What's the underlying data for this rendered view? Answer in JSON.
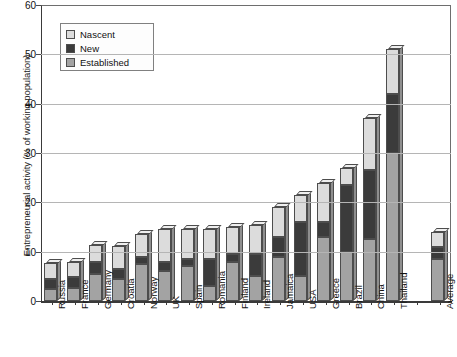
{
  "chart_data": {
    "type": "bar",
    "subtype": "stacked-3d-column",
    "title": "",
    "xlabel": "",
    "ylabel": "Entrepreneurial activity (% of working population)",
    "ylim": [
      0,
      60
    ],
    "yticks": [
      0,
      10,
      20,
      30,
      40,
      50,
      60
    ],
    "ytick_labels": [
      "0",
      "10",
      "20",
      "30",
      "40",
      "50",
      "60"
    ],
    "grid": true,
    "legend_position": "top-left-inside",
    "categories": [
      "Russia",
      "France",
      "Germany",
      "Croatia",
      "Norway",
      "UK",
      "Spain",
      "Romania",
      "Finland",
      "Ireland",
      "Jamaica",
      "USA",
      "Greece",
      "Brazil",
      "China",
      "Thailand",
      "",
      "Average"
    ],
    "series": [
      {
        "name": "Established",
        "color": "#a3a3a3",
        "values": [
          2.5,
          2.7,
          5.5,
          4.5,
          7.5,
          6.0,
          7.0,
          3.0,
          8.0,
          5.0,
          9.0,
          5.0,
          13.0,
          10.0,
          12.5,
          30.0,
          0,
          8.5
        ]
      },
      {
        "name": "New",
        "color": "#3b3b3b",
        "values": [
          2.0,
          2.1,
          2.5,
          2.0,
          1.5,
          2.0,
          1.5,
          5.5,
          1.5,
          4.5,
          4.0,
          11.0,
          3.0,
          13.5,
          14.0,
          12.0,
          0,
          2.5
        ]
      },
      {
        "name": "Nascent",
        "color": "#dcdcdc",
        "values": [
          3.3,
          3.2,
          3.3,
          4.7,
          4.5,
          6.5,
          6.0,
          6.0,
          5.5,
          6.0,
          6.0,
          5.5,
          8.0,
          3.5,
          10.5,
          9.0,
          0,
          3.0
        ]
      }
    ],
    "totals": [
      7.8,
      8.0,
      11.3,
      11.2,
      13.5,
      14.5,
      14.5,
      14.5,
      15.0,
      15.5,
      19.0,
      21.5,
      24.0,
      27.0,
      37.0,
      51.0,
      0,
      14.0
    ]
  },
  "legend": {
    "items": [
      {
        "label": "Nascent",
        "key": "nascent"
      },
      {
        "label": "New",
        "key": "new"
      },
      {
        "label": "Established",
        "key": "established"
      }
    ]
  },
  "colors": {
    "nascent": "#dcdcdc",
    "new": "#3b3b3b",
    "established": "#a3a3a3",
    "axis": "#3a3a3a",
    "grid": "#b5b5b5",
    "background": "#ffffff"
  }
}
